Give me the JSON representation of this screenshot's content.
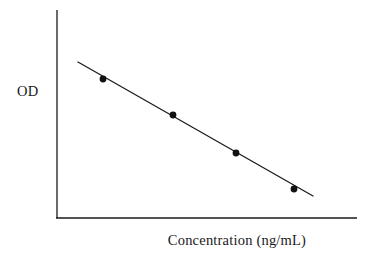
{
  "figure": {
    "background_color": "#ffffff",
    "ink_color": "#1a1a1a",
    "width": 374,
    "height": 271
  },
  "labels": {
    "y_axis": "OD",
    "x_axis": "Concentration (ng/mL)"
  },
  "chart_data": {
    "type": "scatter",
    "title": "",
    "subtitle": "",
    "xlabel": "Concentration (ng/mL)",
    "ylabel": "OD",
    "grid": false,
    "legend": false,
    "legend_position": "none",
    "axis_ticks": "none",
    "tick_labels": [],
    "xlim": [
      0,
      10
    ],
    "ylim": [
      0,
      10
    ],
    "series": [
      {
        "name": "Standard points",
        "marker": "filled-circle",
        "marker_color": "#111111",
        "marker_size_px": 5,
        "x": [
          1.55,
          3.9,
          6.0,
          7.95
        ],
        "y": [
          6.7,
          4.95,
          3.12,
          1.4
        ]
      },
      {
        "name": "Fit line",
        "marker": "none",
        "line_color": "#1a1a1a",
        "line_width_px": 1.2,
        "x": [
          0.7,
          8.6
        ],
        "y": [
          7.5,
          1.05
        ]
      }
    ],
    "points_pixel": [
      {
        "x": 103,
        "y": 79
      },
      {
        "x": 173,
        "y": 115
      },
      {
        "x": 236,
        "y": 153
      },
      {
        "x": 294,
        "y": 189
      }
    ],
    "fit_line_pixel": {
      "x1": 78,
      "y1": 62,
      "x2": 313,
      "y2": 196
    },
    "axes_pixel": {
      "y_axis": {
        "x": 57,
        "y_top": 10,
        "y_bottom": 218
      },
      "x_axis": {
        "y": 218,
        "x_left": 57,
        "x_right": 357
      }
    }
  }
}
